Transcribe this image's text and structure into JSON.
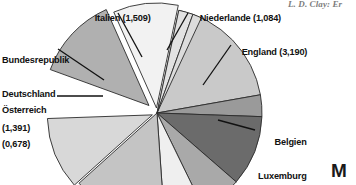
{
  "page": {
    "running_head": "L. D. Clay: Er",
    "folio_mark": "M",
    "background_color": "#ffffff"
  },
  "chart_data": {
    "type": "pie",
    "title": "",
    "units": "Mrd.",
    "value_format": "german-decimal-comma",
    "center": {
      "x": 157,
      "y": 113
    },
    "radius": 105,
    "start_angle_deg": 12,
    "direction": "clockwise",
    "total": 11.247,
    "labels": [
      "England (3,190)",
      "Belgien Luxemburg (0,559)",
      "Österreich (0,678)",
      "Bundesrepublik Deutschland (1,391)",
      "Italien (1,509)",
      "Niederlande (1,084)"
    ],
    "categories": [
      "England",
      "Belgien Luxemburg",
      "Österreich",
      "Bundesrepublik Deutschland",
      "Italien",
      "Niederlande"
    ],
    "values": [
      3.19,
      0.559,
      0.678,
      1.391,
      1.509,
      1.084
    ],
    "slices": [
      {
        "name": "England",
        "label": "England",
        "value_text": "(3,190)",
        "value": 3.19,
        "color": "#c9c9c9",
        "start": 12,
        "end": 80,
        "exploded": false
      },
      {
        "name": "unlabeled-1",
        "label": "",
        "value_text": "",
        "value": null,
        "color": "#9a9a9a",
        "start": 80,
        "end": 92,
        "exploded": false
      },
      {
        "name": "belgien-luxemburg",
        "label": "Belgien Luxemburg",
        "value_text": "(0,559)",
        "value": 0.559,
        "color": "#6b6b6b",
        "start": 92,
        "end": 131,
        "exploded": false
      },
      {
        "name": "unlabeled-2",
        "label": "",
        "value_text": "",
        "value": null,
        "color": "#a9a9a9",
        "start": 131,
        "end": 154,
        "exploded": false
      },
      {
        "name": "unlabeled-3",
        "label": "",
        "value_text": "",
        "value": null,
        "color": "#efefef",
        "start": 154,
        "end": 176,
        "exploded": false
      },
      {
        "name": "unlabeled-4",
        "label": "",
        "value_text": "",
        "value": null,
        "color": "#c4c4c4",
        "start": 176,
        "end": 228,
        "exploded": false
      },
      {
        "name": "oesterreich",
        "label": "Österreich",
        "value_text": "(0,678)",
        "value": 0.678,
        "color": "#d8d8d8",
        "start": 228,
        "end": 268,
        "exploded": true,
        "offset": 5,
        "offset_angle": 248
      },
      {
        "name": "bundesrepublik-deutschland",
        "label": "Bundesrepublik Deutschland",
        "value_text": "(1,391)",
        "value": 1.391,
        "color": "#b0b0b0",
        "start": 290,
        "end": 336,
        "exploded": true,
        "offset": 11,
        "offset_angle": 313
      },
      {
        "name": "italien",
        "label": "Italien",
        "value_text": "(1,509)",
        "value": 1.509,
        "color": "#f2f2f2",
        "start": 336,
        "end": 372,
        "exploded": true,
        "offset": 5,
        "offset_angle": 354
      },
      {
        "name": "niederlande",
        "label": "Niederlande",
        "value_text": "(1,084)",
        "value": 1.084,
        "color": "#e2e2e2",
        "start": 372,
        "end": 380,
        "exploded": false
      },
      {
        "name": "unlabeled-5",
        "label": "",
        "value_text": "",
        "value": null,
        "color": "#dcdcdc",
        "start": 380,
        "end": 385,
        "exploded": false
      }
    ],
    "callouts": [
      {
        "name": "italien",
        "text": "Italien (1,509)",
        "x1": 118,
        "y1": 13,
        "x2": 142,
        "y2": 57
      },
      {
        "name": "niederlande",
        "text": "Niederlande (1,084)",
        "x1": 188,
        "y1": 13,
        "x2": 167,
        "y2": 50
      },
      {
        "name": "england",
        "text": "England (3,190)",
        "x1": 231,
        "y1": 45,
        "x2": 203,
        "y2": 85
      },
      {
        "name": "bundesrepublik",
        "text": "Bundesrepublik Deutschland (1,391)",
        "x1": 58,
        "y1": 49,
        "x2": 104,
        "y2": 80
      },
      {
        "name": "oesterreich",
        "text": "Österreich (0,678)",
        "x1": 57,
        "y1": 96,
        "x2": 103,
        "y2": 96
      },
      {
        "name": "belgien",
        "text": "Belgien Luxemburg (0,559)",
        "x1": 255,
        "y1": 130,
        "x2": 218,
        "y2": 120
      }
    ],
    "legend_position": "callout-labels",
    "grid": false
  },
  "annotations": {
    "italien": {
      "line1": "Italien (1,509)"
    },
    "niederlande": {
      "line1": "Niederlande (1,084)"
    },
    "england": {
      "line1": "England (3,190)"
    },
    "bundesrepublik": {
      "line1": "Bundesrepublik",
      "line2": "Deutschland",
      "line3": "(1,391)"
    },
    "oesterreich": {
      "line1": "Österreich",
      "line2": "(0,678)"
    },
    "belgien": {
      "line1": "Belgien",
      "line2": "Luxemburg",
      "line3": "(0,559)"
    }
  }
}
